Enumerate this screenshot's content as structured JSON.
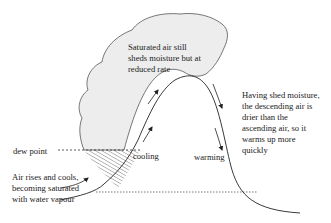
{
  "diagram": {
    "labels": {
      "cloud_text": [
        "Saturated air still",
        "sheds moisture but at",
        "reduced rate"
      ],
      "dew_point": "dew point",
      "rising": [
        "Air rises and cools,",
        "becoming saturated",
        "with water vapour"
      ],
      "cooling": "cooling",
      "warming": "warming",
      "descending": [
        "Having shed moisture,",
        "the descending air is",
        "drier than the",
        "ascending air, so it",
        "warms up more",
        "quickly"
      ]
    },
    "colors": {
      "cloud_fill": "#ededed",
      "line": "#222222",
      "hatch": "#444444",
      "background": "#ffffff"
    }
  }
}
